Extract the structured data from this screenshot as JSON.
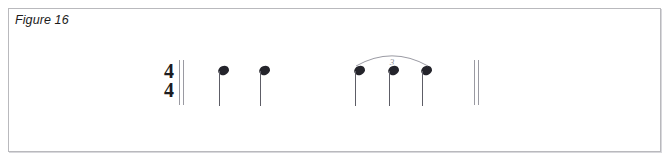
{
  "figure": {
    "caption": "Figure 16",
    "border_color": "#b9b9bd",
    "background_color": "#ffffff"
  },
  "notation": {
    "time_signature": {
      "numerator": "4",
      "denominator": "4",
      "x": 160,
      "y": 62
    },
    "opening_barline": {
      "type": "double-thin",
      "x": 179,
      "y": 60,
      "height": 45,
      "line_offsets": [
        0,
        4
      ]
    },
    "closing_barline": {
      "type": "double-thin",
      "x": 474,
      "y": 60,
      "height": 45,
      "line_offsets": [
        0,
        4
      ]
    },
    "notes": [
      {
        "id": "note-1",
        "type": "quarter",
        "x": 218,
        "y": 66,
        "stem": "down",
        "group": "none"
      },
      {
        "id": "note-2",
        "type": "quarter",
        "x": 259,
        "y": 66,
        "stem": "down",
        "group": "none"
      },
      {
        "id": "note-3",
        "type": "quarter",
        "x": 354,
        "y": 66,
        "stem": "down",
        "group": "triplet"
      },
      {
        "id": "note-4",
        "type": "quarter",
        "x": 388,
        "y": 66,
        "stem": "down",
        "group": "triplet"
      },
      {
        "id": "note-5",
        "type": "quarter",
        "x": 421,
        "y": 66,
        "stem": "down",
        "group": "triplet"
      }
    ],
    "triplet": {
      "number": "3",
      "slur_x": 356,
      "slur_y": 52,
      "slur_width": 72,
      "slur_height": 14,
      "number_x": 387,
      "number_y": 58,
      "color": "#8f8f99"
    },
    "note_color": "#24242b",
    "stem_color": "#5d5d66",
    "barline_color": "#9a9aa2"
  }
}
